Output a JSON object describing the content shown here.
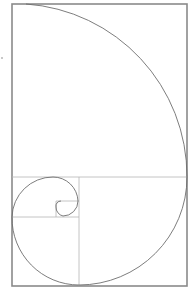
{
  "diagram": {
    "type": "golden-rectangle-spiral",
    "colors": {
      "background": "#ffffff",
      "frame": "#8a8a8a",
      "grid": "#b5b5b5",
      "spiral": "#6e6e6e"
    },
    "frame": {
      "x": 12,
      "y": 4,
      "width": 175,
      "height": 282
    },
    "squares": [
      {
        "x": 12,
        "y": 4,
        "size": 173
      },
      {
        "x": 79,
        "y": 177,
        "size": 108
      },
      {
        "x": 12,
        "y": 217,
        "size": 67
      },
      {
        "x": 12,
        "y": 177,
        "size": 40
      },
      {
        "x": 52,
        "y": 177,
        "size": 27
      },
      {
        "x": 66,
        "y": 204,
        "size": 13
      }
    ]
  }
}
